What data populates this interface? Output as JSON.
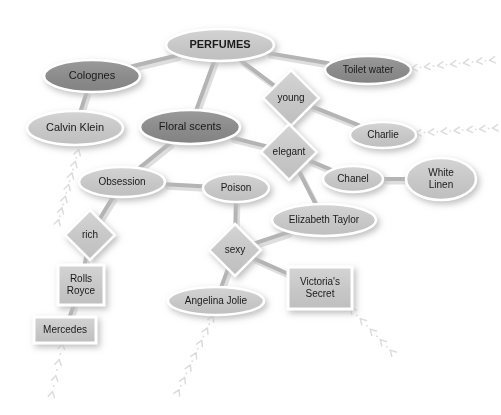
{
  "diagram": {
    "type": "concept-map",
    "canvas": {
      "width": 501,
      "height": 415,
      "background": "#ffffff"
    },
    "styles": {
      "fill_dark": "#8d8d8d",
      "fill_light": "#c9c9c9",
      "stroke_outline": "#ffffff",
      "edge_color": "#b4b4b4",
      "text_color": "#1a1a1a",
      "trail_color": "#dcdcdc",
      "shadow_color": "#c4c4c4"
    },
    "nodes": [
      {
        "id": "perfumes",
        "label": "PERFUMES",
        "shape": "ellipse",
        "tone": "light",
        "bold": true,
        "cx": 220,
        "cy": 45,
        "rx": 54,
        "ry": 16,
        "font_size": 11,
        "lines": [
          "PERFUMES"
        ]
      },
      {
        "id": "colognes",
        "label": "Colognes",
        "shape": "ellipse",
        "tone": "dark",
        "bold": false,
        "cx": 92,
        "cy": 76,
        "rx": 48,
        "ry": 16,
        "font_size": 11,
        "lines": [
          "Colognes"
        ]
      },
      {
        "id": "toilet_water",
        "label": "Toilet water",
        "shape": "ellipse",
        "tone": "dark",
        "bold": false,
        "cx": 368,
        "cy": 70,
        "rx": 43,
        "ry": 14,
        "font_size": 10,
        "lines": [
          "Toilet water"
        ]
      },
      {
        "id": "calvin_klein",
        "label": "Calvin Klein",
        "shape": "ellipse",
        "tone": "light",
        "bold": false,
        "cx": 75,
        "cy": 128,
        "rx": 48,
        "ry": 17,
        "font_size": 11,
        "lines": [
          "Calvin Klein"
        ]
      },
      {
        "id": "floral_scents",
        "label": "Floral scents",
        "shape": "ellipse",
        "tone": "dark",
        "bold": false,
        "cx": 190,
        "cy": 127,
        "rx": 50,
        "ry": 17,
        "font_size": 11,
        "lines": [
          "Floral scents"
        ]
      },
      {
        "id": "young",
        "label": "young",
        "shape": "diamond",
        "tone": "light",
        "bold": false,
        "cx": 291,
        "cy": 98,
        "rx": 28,
        "ry": 28,
        "font_size": 10,
        "lines": [
          "young"
        ]
      },
      {
        "id": "elegant",
        "label": "elegant",
        "shape": "diamond",
        "tone": "light",
        "bold": false,
        "cx": 289,
        "cy": 152,
        "rx": 28,
        "ry": 28,
        "font_size": 10,
        "lines": [
          "elegant"
        ]
      },
      {
        "id": "charlie",
        "label": "Charlie",
        "shape": "ellipse",
        "tone": "light",
        "bold": false,
        "cx": 383,
        "cy": 135,
        "rx": 33,
        "ry": 13,
        "font_size": 10,
        "lines": [
          "Charlie"
        ]
      },
      {
        "id": "chanel",
        "label": "Chanel",
        "shape": "ellipse",
        "tone": "light",
        "bold": false,
        "cx": 353,
        "cy": 179,
        "rx": 30,
        "ry": 13,
        "font_size": 10,
        "lines": [
          "Chanel"
        ]
      },
      {
        "id": "white_linen",
        "label": "White Linen",
        "shape": "ellipse",
        "tone": "light",
        "bold": false,
        "cx": 441,
        "cy": 179,
        "rx": 35,
        "ry": 21,
        "font_size": 10,
        "lines": [
          "White",
          "Linen"
        ]
      },
      {
        "id": "obsession",
        "label": "Obsession",
        "shape": "ellipse",
        "tone": "light",
        "bold": false,
        "cx": 122,
        "cy": 182,
        "rx": 43,
        "ry": 15,
        "font_size": 10,
        "lines": [
          "Obsession"
        ]
      },
      {
        "id": "poison",
        "label": "Poison",
        "shape": "ellipse",
        "tone": "light",
        "bold": false,
        "cx": 236,
        "cy": 188,
        "rx": 33,
        "ry": 14,
        "font_size": 10,
        "lines": [
          "Poison"
        ]
      },
      {
        "id": "elizabeth_taylor",
        "label": "Elizabeth Taylor",
        "shape": "ellipse",
        "tone": "light",
        "bold": false,
        "cx": 324,
        "cy": 220,
        "rx": 52,
        "ry": 16,
        "font_size": 10,
        "lines": [
          "Elizabeth Taylor"
        ]
      },
      {
        "id": "rich",
        "label": "rich",
        "shape": "diamond",
        "tone": "light",
        "bold": false,
        "cx": 90,
        "cy": 235,
        "rx": 25,
        "ry": 25,
        "font_size": 10,
        "lines": [
          "rich"
        ]
      },
      {
        "id": "sexy",
        "label": "sexy",
        "shape": "diamond",
        "tone": "light",
        "bold": false,
        "cx": 235,
        "cy": 250,
        "rx": 26,
        "ry": 26,
        "font_size": 10,
        "lines": [
          "sexy"
        ]
      },
      {
        "id": "rolls_royce",
        "label": "Rolls Royce",
        "shape": "rectangle",
        "tone": "light",
        "bold": false,
        "cx": 81,
        "cy": 285,
        "rx": 23,
        "ry": 20,
        "font_size": 10,
        "lines": [
          "Rolls",
          "Royce"
        ]
      },
      {
        "id": "victorias_secret",
        "label": "Victoria's Secret",
        "shape": "rectangle",
        "tone": "light",
        "bold": false,
        "cx": 320,
        "cy": 288,
        "rx": 32,
        "ry": 21,
        "font_size": 10,
        "lines": [
          "Victoria's",
          "Secret"
        ]
      },
      {
        "id": "angelina_jolie",
        "label": "Angelina Jolie",
        "shape": "ellipse",
        "tone": "light",
        "bold": false,
        "cx": 216,
        "cy": 301,
        "rx": 48,
        "ry": 14,
        "font_size": 10,
        "lines": [
          "Angelina Jolie"
        ]
      },
      {
        "id": "mercedes",
        "label": "Mercedes",
        "shape": "rectangle",
        "tone": "light",
        "bold": false,
        "cx": 65,
        "cy": 330,
        "rx": 31,
        "ry": 13,
        "font_size": 10,
        "lines": [
          "Mercedes"
        ]
      }
    ],
    "edges": [
      {
        "from": "perfumes",
        "to": "colognes"
      },
      {
        "from": "perfumes",
        "to": "toilet_water"
      },
      {
        "from": "perfumes",
        "to": "floral_scents"
      },
      {
        "from": "perfumes",
        "to": "young"
      },
      {
        "from": "colognes",
        "to": "calvin_klein"
      },
      {
        "from": "young",
        "to": "charlie"
      },
      {
        "from": "young",
        "to": "elegant"
      },
      {
        "from": "elegant",
        "to": "chanel"
      },
      {
        "from": "elegant",
        "to": "elizabeth_taylor"
      },
      {
        "from": "floral_scents",
        "to": "elegant"
      },
      {
        "from": "floral_scents",
        "to": "obsession"
      },
      {
        "from": "chanel",
        "to": "white_linen"
      },
      {
        "from": "obsession",
        "to": "poison"
      },
      {
        "from": "obsession",
        "to": "rich"
      },
      {
        "from": "poison",
        "to": "sexy"
      },
      {
        "from": "elizabeth_taylor",
        "to": "sexy"
      },
      {
        "from": "rich",
        "to": "rolls_royce"
      },
      {
        "from": "sexy",
        "to": "angelina_jolie"
      },
      {
        "from": "sexy",
        "to": "victorias_secret"
      },
      {
        "from": "rolls_royce",
        "to": "mercedes"
      }
    ],
    "trails": [
      {
        "id": "trail-toilet-water",
        "x1": 414,
        "y1": 68,
        "x2": 492,
        "y2": 60
      },
      {
        "id": "trail-charlie",
        "x1": 418,
        "y1": 133,
        "x2": 495,
        "y2": 128
      },
      {
        "id": "trail-calvin-klein",
        "x1": 78,
        "y1": 152,
        "x2": 58,
        "y2": 222
      },
      {
        "id": "trail-mercedes",
        "x1": 62,
        "y1": 346,
        "x2": 52,
        "y2": 394
      },
      {
        "id": "trail-angelina-jolie",
        "x1": 212,
        "y1": 318,
        "x2": 178,
        "y2": 392
      },
      {
        "id": "trail-victorias-secret",
        "x1": 352,
        "y1": 310,
        "x2": 392,
        "y2": 352
      }
    ]
  }
}
